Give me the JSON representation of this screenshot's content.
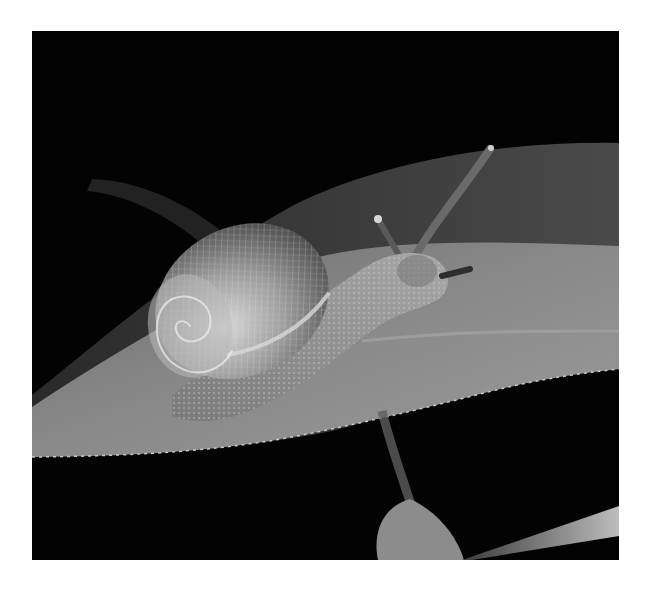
{
  "image": {
    "caption": "Black-and-white photograph of a garden snail crawling on a leaf against a black background",
    "subject": "snail",
    "style": "monochrome",
    "background_color": "#030303",
    "border_color": "#ffffff"
  }
}
